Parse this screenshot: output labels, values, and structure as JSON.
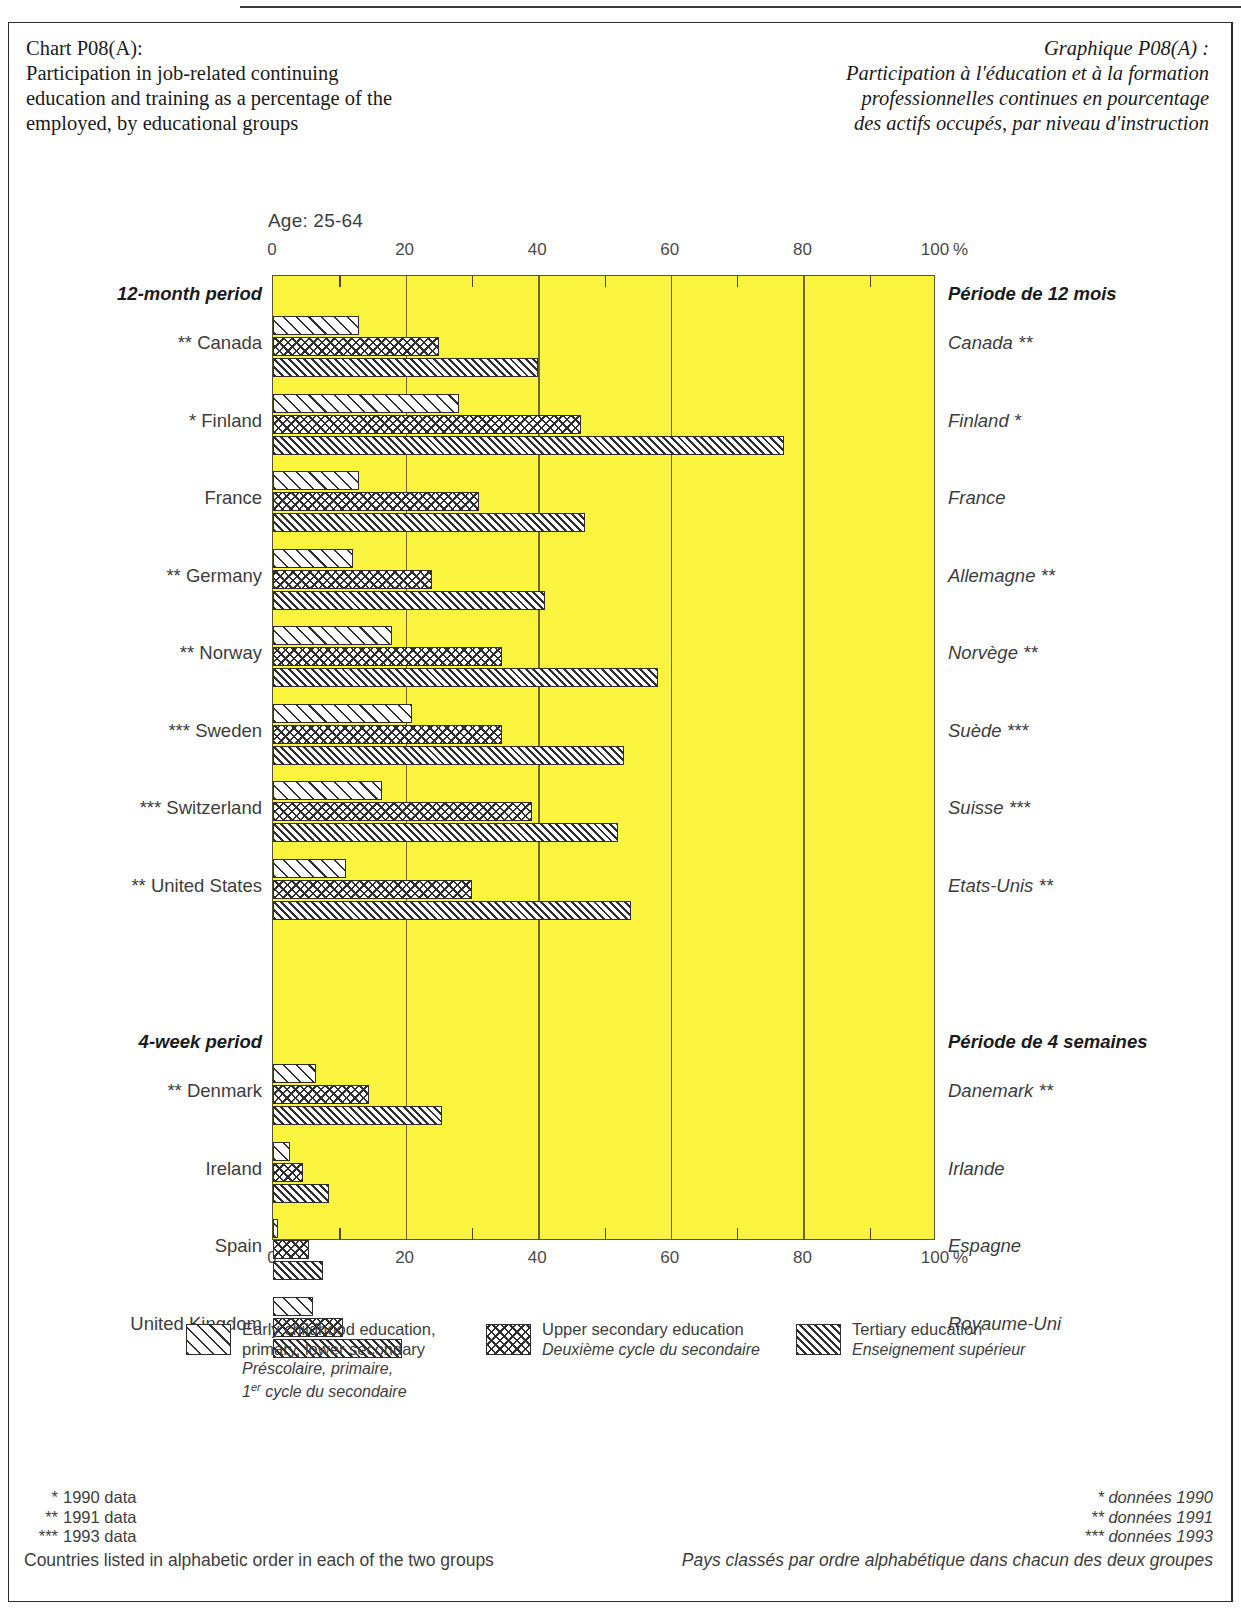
{
  "titles": {
    "en": "Chart P08(A):\nParticipation in job-related continuing\neducation and training as a percentage of the\nemployed, by educational groups",
    "fr": "Graphique P08(A) :\nParticipation à l'éducation et à la formation\nprofessionnelles continues en pourcentage\ndes actifs occupés, par niveau d'instruction"
  },
  "age_label": "Age: 25-64",
  "axis": {
    "unit": "%",
    "ticks": [
      "0",
      "20",
      "40",
      "60",
      "80",
      "100"
    ],
    "min": 0,
    "max": 100
  },
  "groups": [
    {
      "label_en": "12-month period",
      "label_fr": "Période de 12 mois"
    },
    {
      "label_en": "4-week period",
      "label_fr": "Période de 4 semaines"
    }
  ],
  "legend": [
    {
      "key": "early-childhood",
      "en_line1": "Early childhood education,",
      "en_line2": "primary, lower secondary",
      "fr_line1": "Préscolaire, primaire,",
      "fr_line2": "1er cycle du secondaire",
      "fr_line2_sup": "er",
      "fr_line2_rest": " cycle du secondaire",
      "fr_line2_num": "1"
    },
    {
      "key": "upper-secondary",
      "en_line1": "Upper secondary education",
      "en_line2": "",
      "fr_line1": "Deuxième cycle du secondaire",
      "fr_line2": ""
    },
    {
      "key": "tertiary",
      "en_line1": "Tertiary education",
      "en_line2": "",
      "fr_line1": "Enseignement supérieur",
      "fr_line2": ""
    }
  ],
  "footnotes": {
    "en": [
      {
        "stars": "*",
        "text": "1990 data"
      },
      {
        "stars": "**",
        "text": "1991 data"
      },
      {
        "stars": "***",
        "text": "1993 data"
      }
    ],
    "en_note": "Countries listed in alphabetic order in each of the two groups",
    "fr": [
      {
        "stars": "*",
        "text": "données 1990"
      },
      {
        "stars": "**",
        "text": "données 1991"
      },
      {
        "stars": "***",
        "text": "données 1993"
      }
    ],
    "fr_note": "Pays classés par ordre alphabétique dans chacun des deux groupes"
  },
  "chart_data": {
    "type": "bar",
    "subtitle": "Age: 25-64",
    "xlabel": "%",
    "ylabel": "",
    "xlim": [
      0,
      100
    ],
    "orientation": "horizontal",
    "grid": true,
    "legend_position": "bottom",
    "series": [
      {
        "name": "Early childhood education, primary, lower secondary",
        "pattern": "diagonal-wide"
      },
      {
        "name": "Upper secondary education",
        "pattern": "checkerboard"
      },
      {
        "name": "Tertiary education",
        "pattern": "diagonal-tight"
      }
    ],
    "categories": [
      "Canada",
      "Finland",
      "France",
      "Germany",
      "Norway",
      "Sweden",
      "Switzerland",
      "United States",
      "Denmark",
      "Ireland",
      "Spain",
      "United Kingdom"
    ],
    "rows": [
      {
        "group": "12-month period",
        "name_en": "Canada",
        "name_fr": "Canada",
        "stars": "**",
        "values": [
          13.0,
          25.0,
          40.0
        ]
      },
      {
        "group": "12-month period",
        "name_en": "Finland",
        "name_fr": "Finland",
        "stars": "*",
        "values": [
          28.0,
          46.5,
          77.0
        ]
      },
      {
        "group": "12-month period",
        "name_en": "France",
        "name_fr": "France",
        "stars": "",
        "values": [
          13.0,
          31.0,
          47.0
        ]
      },
      {
        "group": "12-month period",
        "name_en": "Germany",
        "name_fr": "Allemagne",
        "stars": "**",
        "values": [
          12.0,
          24.0,
          41.0
        ]
      },
      {
        "group": "12-month period",
        "name_en": "Norway",
        "name_fr": "Norvège",
        "stars": "**",
        "values": [
          18.0,
          34.5,
          58.0
        ]
      },
      {
        "group": "12-month period",
        "name_en": "Sweden",
        "name_fr": "Suède",
        "stars": "***",
        "values": [
          21.0,
          34.5,
          53.0
        ]
      },
      {
        "group": "12-month period",
        "name_en": "Switzerland",
        "name_fr": "Suisse",
        "stars": "***",
        "values": [
          16.5,
          39.0,
          52.0
        ]
      },
      {
        "group": "12-month period",
        "name_en": "United States",
        "name_fr": "Etats-Unis",
        "stars": "**",
        "values": [
          11.0,
          30.0,
          54.0
        ]
      },
      {
        "group": "4-week period",
        "name_en": "Denmark",
        "name_fr": "Danemark",
        "stars": "**",
        "values": [
          6.5,
          14.5,
          25.5
        ]
      },
      {
        "group": "4-week period",
        "name_en": "Ireland",
        "name_fr": "Irlande",
        "stars": "",
        "values": [
          2.5,
          4.5,
          8.5
        ]
      },
      {
        "group": "4-week period",
        "name_en": "Spain",
        "name_fr": "Espagne",
        "stars": "",
        "values": [
          0.8,
          5.5,
          7.5
        ]
      },
      {
        "group": "4-week period",
        "name_en": "United Kingdom",
        "name_fr": "Royaume-Uni",
        "stars": "",
        "values": [
          6.0,
          10.5,
          19.5
        ]
      }
    ]
  }
}
